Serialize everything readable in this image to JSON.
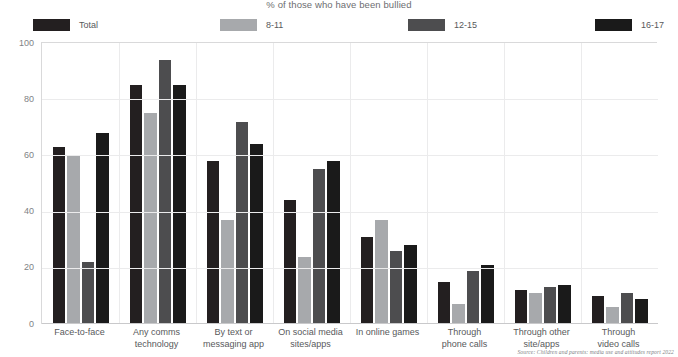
{
  "chart_data": {
    "type": "bar",
    "title": "",
    "subtitle": "% of those who have been bullied",
    "xlabel": "",
    "ylabel": "",
    "ylim": [
      0,
      100
    ],
    "yticks": [
      0,
      20,
      40,
      60,
      80,
      100
    ],
    "ytick_labels": [
      "0",
      "20",
      "40",
      "60",
      "80",
      "100"
    ],
    "grid": true,
    "legend_position": "top",
    "categories": [
      "Face-to-face",
      "Any comms technology",
      "By text or messaging app",
      "On social media sites/apps",
      "In online games",
      "Through phone calls",
      "Through other site/apps",
      "Through video calls"
    ],
    "category_lines": [
      [
        "Face-to-face"
      ],
      [
        "Any comms",
        "technology"
      ],
      [
        "By text or",
        "messaging app"
      ],
      [
        "On social media",
        "sites/apps"
      ],
      [
        "In online games"
      ],
      [
        "Through",
        "phone calls"
      ],
      [
        "Through other",
        "site/apps"
      ],
      [
        "Through",
        "video calls"
      ]
    ],
    "series": [
      {
        "name": "Total",
        "color": "#231f20",
        "values": [
          63,
          85,
          58,
          44,
          31,
          15,
          12,
          10
        ]
      },
      {
        "name": "8-11",
        "color": "#a7a9ac",
        "values": [
          60,
          75,
          37,
          24,
          37,
          7,
          11,
          6
        ]
      },
      {
        "name": "12-15",
        "color": "#4d4d4f",
        "values": [
          22,
          94,
          72,
          55,
          26,
          19,
          13,
          11
        ]
      },
      {
        "name": "16-17",
        "color": "#1a1a1a",
        "values": [
          68,
          85,
          64,
          58,
          28,
          21,
          14,
          9
        ]
      }
    ],
    "source": "Source: Children and parents: media use and attitudes report 2022"
  },
  "legend": {
    "items": [
      {
        "label": "Total",
        "color": "#231f20"
      },
      {
        "label": "8-11",
        "color": "#a7a9ac"
      },
      {
        "label": "12-15",
        "color": "#4d4d4f"
      },
      {
        "label": "16-17",
        "color": "#1a1a1a"
      }
    ]
  },
  "colors": {
    "gridline": "#ebebec",
    "axis": "#d9d9da",
    "text": "#58595b",
    "muted_text": "#808285",
    "background": "#ffffff"
  }
}
